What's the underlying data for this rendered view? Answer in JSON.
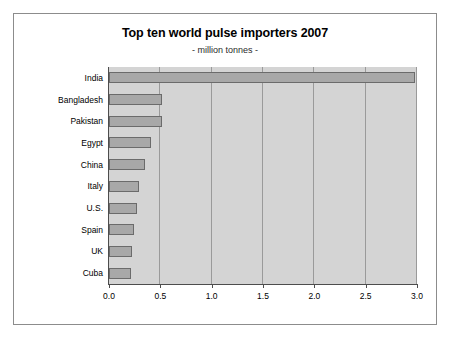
{
  "chart_data": {
    "type": "bar",
    "orientation": "horizontal",
    "title": "Top ten world pulse importers 2007",
    "subtitle": "- million tonnes -",
    "xlabel": "",
    "ylabel": "",
    "categories": [
      "India",
      "Bangladesh",
      "Pakistan",
      "Egypt",
      "China",
      "Italy",
      "U.S.",
      "Spain",
      "UK",
      "Cuba"
    ],
    "values": [
      2.98,
      0.52,
      0.52,
      0.41,
      0.35,
      0.29,
      0.27,
      0.24,
      0.22,
      0.21
    ],
    "xlim": [
      0.0,
      3.0
    ],
    "xticks": [
      "0.0",
      "0.5",
      "1.0",
      "1.5",
      "2.0",
      "2.5",
      "3.0"
    ],
    "xtick_values": [
      0.0,
      0.5,
      1.0,
      1.5,
      2.0,
      2.5,
      3.0
    ],
    "grid": true,
    "grid_axis": "x",
    "legend": false,
    "colors": {
      "bar_fill": "#a8a8a8",
      "bar_border": "#6b6b6b",
      "plot_background": "#d4d4d4",
      "axis": "#4d4d4d",
      "gridline": "#9a9a9a",
      "frame_border": "#8c8c8c",
      "page_background": "#ffffff",
      "text": "#000000"
    }
  }
}
